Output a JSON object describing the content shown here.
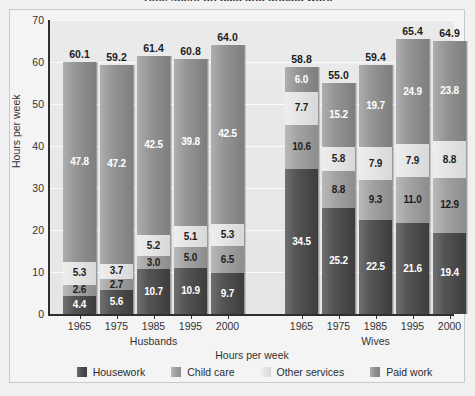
{
  "title": "Time spent on paid and unpaid work",
  "axes": {
    "ylabel": "Hours per week",
    "xlabel": "Hours per week",
    "yticks": [
      "0",
      "10",
      "20",
      "30",
      "40",
      "50",
      "60",
      "70"
    ],
    "ymin": 0,
    "ymax": 70
  },
  "legend": [
    {
      "label": "Housework",
      "key": "housework",
      "color": "#4a4a4a"
    },
    {
      "label": "Child care",
      "key": "childcare",
      "color": "#a2a2a2"
    },
    {
      "label": "Other services",
      "key": "other",
      "color": "#e4e4e4"
    },
    {
      "label": "Paid work",
      "key": "paid",
      "color": "#949494"
    }
  ],
  "groups": [
    {
      "name": "Husbands",
      "years": [
        "1965",
        "1975",
        "1985",
        "1995",
        "2000"
      ]
    },
    {
      "name": "Wives",
      "years": [
        "1965",
        "1975",
        "1985",
        "1995",
        "2000"
      ]
    }
  ],
  "chart_data": {
    "type": "bar",
    "title": "Time spent on paid and unpaid work",
    "xlabel": "Hours per week",
    "ylabel": "Hours per week",
    "ylim": [
      0,
      70
    ],
    "ytick_step": 10,
    "grid": true,
    "stacked": true,
    "legend_position": "bottom",
    "stack_order_bottom_to_top": [
      "Housework",
      "Child care",
      "Other services",
      "Paid work"
    ],
    "categories": [
      "Husbands 1965",
      "Husbands 1975",
      "Husbands 1985",
      "Husbands 1995",
      "Husbands 2000",
      "Wives 1965",
      "Wives 1975",
      "Wives 1985",
      "Wives 1995",
      "Wives 2000"
    ],
    "series": [
      {
        "name": "Housework",
        "values": [
          4.4,
          5.6,
          10.7,
          10.9,
          9.7,
          34.5,
          25.2,
          22.5,
          21.6,
          19.4
        ]
      },
      {
        "name": "Child care",
        "values": [
          2.6,
          2.7,
          3.0,
          5.0,
          6.5,
          10.6,
          8.8,
          9.3,
          11.0,
          12.9
        ]
      },
      {
        "name": "Other services",
        "values": [
          5.3,
          3.7,
          5.2,
          5.1,
          5.3,
          7.7,
          5.8,
          7.9,
          7.9,
          8.8
        ]
      },
      {
        "name": "Paid work",
        "values": [
          47.8,
          47.2,
          42.5,
          39.8,
          42.5,
          6.0,
          15.2,
          19.7,
          24.9,
          23.8
        ]
      }
    ],
    "totals": [
      60.1,
      59.2,
      61.4,
      60.8,
      64.0,
      58.8,
      55.0,
      59.4,
      65.4,
      64.9
    ]
  },
  "bars": [
    {
      "group": 0,
      "year": "1965",
      "total": "60.1",
      "segments": [
        {
          "key": "housework",
          "value": 4.4,
          "label": "4.4",
          "text": "dark"
        },
        {
          "key": "childcare",
          "value": 2.6,
          "label": "2.6",
          "text": "light"
        },
        {
          "key": "other",
          "value": 5.3,
          "label": "5.3",
          "text": "light"
        },
        {
          "key": "paid",
          "value": 47.8,
          "label": "47.8",
          "text": "dark"
        }
      ]
    },
    {
      "group": 0,
      "year": "1975",
      "total": "59.2",
      "segments": [
        {
          "key": "housework",
          "value": 5.6,
          "label": "5.6",
          "text": "dark"
        },
        {
          "key": "childcare",
          "value": 2.7,
          "label": "2.7",
          "text": "light"
        },
        {
          "key": "other",
          "value": 3.7,
          "label": "3.7",
          "text": "light"
        },
        {
          "key": "paid",
          "value": 47.2,
          "label": "47.2",
          "text": "dark"
        }
      ]
    },
    {
      "group": 0,
      "year": "1985",
      "total": "61.4",
      "segments": [
        {
          "key": "housework",
          "value": 10.7,
          "label": "10.7",
          "text": "dark"
        },
        {
          "key": "childcare",
          "value": 3.0,
          "label": "3.0",
          "text": "light"
        },
        {
          "key": "other",
          "value": 5.2,
          "label": "5.2",
          "text": "light"
        },
        {
          "key": "paid",
          "value": 42.5,
          "label": "42.5",
          "text": "dark"
        }
      ]
    },
    {
      "group": 0,
      "year": "1995",
      "total": "60.8",
      "segments": [
        {
          "key": "housework",
          "value": 10.9,
          "label": "10.9",
          "text": "dark"
        },
        {
          "key": "childcare",
          "value": 5.0,
          "label": "5.0",
          "text": "light"
        },
        {
          "key": "other",
          "value": 5.1,
          "label": "5.1",
          "text": "light"
        },
        {
          "key": "paid",
          "value": 39.8,
          "label": "39.8",
          "text": "dark"
        }
      ]
    },
    {
      "group": 0,
      "year": "2000",
      "total": "64.0",
      "segments": [
        {
          "key": "housework",
          "value": 9.7,
          "label": "9.7",
          "text": "dark"
        },
        {
          "key": "childcare",
          "value": 6.5,
          "label": "6.5",
          "text": "light"
        },
        {
          "key": "other",
          "value": 5.3,
          "label": "5.3",
          "text": "light"
        },
        {
          "key": "paid",
          "value": 42.5,
          "label": "42.5",
          "text": "dark"
        }
      ]
    },
    {
      "group": 1,
      "year": "1965",
      "total": "58.8",
      "segments": [
        {
          "key": "housework",
          "value": 34.5,
          "label": "34.5",
          "text": "dark"
        },
        {
          "key": "childcare",
          "value": 10.6,
          "label": "10.6",
          "text": "light"
        },
        {
          "key": "other",
          "value": 7.7,
          "label": "7.7",
          "text": "light"
        },
        {
          "key": "paid",
          "value": 6.0,
          "label": "6.0",
          "text": "dark"
        }
      ]
    },
    {
      "group": 1,
      "year": "1975",
      "total": "55.0",
      "segments": [
        {
          "key": "housework",
          "value": 25.2,
          "label": "25.2",
          "text": "dark"
        },
        {
          "key": "childcare",
          "value": 8.8,
          "label": "8.8",
          "text": "light"
        },
        {
          "key": "other",
          "value": 5.8,
          "label": "5.8",
          "text": "light"
        },
        {
          "key": "paid",
          "value": 15.2,
          "label": "15.2",
          "text": "dark"
        }
      ]
    },
    {
      "group": 1,
      "year": "1985",
      "total": "59.4",
      "segments": [
        {
          "key": "housework",
          "value": 22.5,
          "label": "22.5",
          "text": "dark"
        },
        {
          "key": "childcare",
          "value": 9.3,
          "label": "9.3",
          "text": "light"
        },
        {
          "key": "other",
          "value": 7.9,
          "label": "7.9",
          "text": "light"
        },
        {
          "key": "paid",
          "value": 19.7,
          "label": "19.7",
          "text": "dark"
        }
      ]
    },
    {
      "group": 1,
      "year": "1995",
      "total": "65.4",
      "segments": [
        {
          "key": "housework",
          "value": 21.6,
          "label": "21.6",
          "text": "dark"
        },
        {
          "key": "childcare",
          "value": 11.0,
          "label": "11.0",
          "text": "light"
        },
        {
          "key": "other",
          "value": 7.9,
          "label": "7.9",
          "text": "light"
        },
        {
          "key": "paid",
          "value": 24.9,
          "label": "24.9",
          "text": "dark"
        }
      ]
    },
    {
      "group": 1,
      "year": "2000",
      "total": "64.9",
      "segments": [
        {
          "key": "housework",
          "value": 19.4,
          "label": "19.4",
          "text": "dark"
        },
        {
          "key": "childcare",
          "value": 12.9,
          "label": "12.9",
          "text": "light"
        },
        {
          "key": "other",
          "value": 8.8,
          "label": "8.8",
          "text": "light"
        },
        {
          "key": "paid",
          "value": 23.8,
          "label": "23.8",
          "text": "dark"
        }
      ]
    }
  ]
}
